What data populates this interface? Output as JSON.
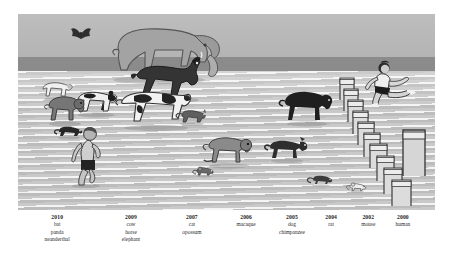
{
  "figure": {
    "caption_rows": [
      {
        "year": "2010",
        "center_pct": 9.4,
        "species": [
          "bat",
          "panda",
          "neanderthal"
        ]
      },
      {
        "year": "2009",
        "center_pct": 27.1,
        "species": [
          "cow",
          "horse",
          "elephant"
        ]
      },
      {
        "year": "2007",
        "center_pct": 41.7,
        "species": [
          "cat",
          "opossum"
        ]
      },
      {
        "year": "2006",
        "center_pct": 54.7,
        "species": [
          "macaque"
        ]
      },
      {
        "year": "2005",
        "center_pct": 65.7,
        "species": [
          "dog",
          "chimpanzee"
        ]
      },
      {
        "year": "2004",
        "center_pct": 75.1,
        "species": [
          "rat"
        ]
      },
      {
        "year": "2002",
        "center_pct": 84.0,
        "species": [
          "mouse"
        ]
      },
      {
        "year": "2000",
        "center_pct": 92.3,
        "species": [
          "human"
        ]
      }
    ]
  },
  "scene": {
    "description": "Running track with animals and humans racing toward the viewer",
    "colors": {
      "sky": "#b9b9b9",
      "dark_band": "#8b8b8b",
      "track": "#c2c2c2",
      "lane_line": "#f2f2f2",
      "figure_dark": "#2b2b2b",
      "figure_mid": "#6f6f6f",
      "figure_light": "#e8e8e8",
      "shadow": "#9a9a9a"
    },
    "runners": [
      {
        "name": "elephant",
        "label": "elephant",
        "x": 21.0,
        "y": 4.0
      },
      {
        "name": "bat",
        "label": "bat",
        "x": 13.5,
        "y": 6.5
      },
      {
        "name": "horse",
        "label": "horse",
        "x": 28.0,
        "y": 21.0
      },
      {
        "name": "cow",
        "label": "cow",
        "x": 23.5,
        "y": 38.0
      },
      {
        "name": "panda",
        "label": "panda",
        "x": 13.5,
        "y": 38.0
      },
      {
        "name": "sheep",
        "label": "sheep",
        "x": 6.0,
        "y": 34.0
      },
      {
        "name": "macaque-left",
        "label": "macaque",
        "x": 7.0,
        "y": 40.0
      },
      {
        "name": "opossum",
        "label": "opossum",
        "x": 9.0,
        "y": 57.0
      },
      {
        "name": "neanderthal",
        "label": "neanderthal",
        "x": 12.0,
        "y": 60.0
      },
      {
        "name": "cat",
        "label": "cat",
        "x": 38.0,
        "y": 49.0
      },
      {
        "name": "macaque",
        "label": "macaque",
        "x": 45.0,
        "y": 61.0
      },
      {
        "name": "dog",
        "label": "dog",
        "x": 60.0,
        "y": 64.0
      },
      {
        "name": "chimpanzee",
        "label": "chimpanzee",
        "x": 63.5,
        "y": 40.0
      },
      {
        "name": "mouse-small",
        "label": "mouse",
        "x": 42.0,
        "y": 78.0
      },
      {
        "name": "rat",
        "label": "rat",
        "x": 70.0,
        "y": 82.0
      },
      {
        "name": "mouse",
        "label": "mouse",
        "x": 79.0,
        "y": 86.0
      },
      {
        "name": "human",
        "label": "human",
        "x": 84.5,
        "y": 27.0
      }
    ],
    "hurdles_count": 13
  }
}
